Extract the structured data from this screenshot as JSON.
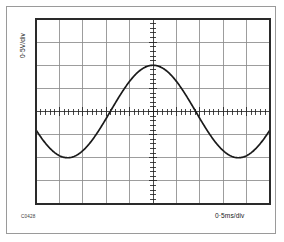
{
  "figure": {
    "code": "C0428",
    "background_color": "#ffffff",
    "frame_color": "#9a9a9a"
  },
  "labels": {
    "vertical_axis": "0·5V/div",
    "horizontal_axis": "0·5ms/div"
  },
  "chart_data": {
    "type": "line",
    "title": "",
    "subtitle": "",
    "xlabel": "0·5ms/div",
    "ylabel": "0·5V/div",
    "grid": true,
    "legend_position": "none",
    "annotations": [
      "C0428"
    ],
    "graticule": {
      "horizontal_divisions": 10,
      "vertical_divisions": 8,
      "division_px_x": 23.4,
      "division_px_y": 23.1,
      "grid_line_color": "#8c8c8c",
      "border_color": "#2a2a2a",
      "center_axis_ticks": true,
      "ticks_per_division": 5
    },
    "waveform": {
      "shape": "sine",
      "trace_color": "#1a1a1a",
      "trace_width_px": 1.6,
      "amplitude_divisions": 2.0,
      "amplitude_volts": 1.0,
      "peak_to_peak_volts": 2.0,
      "period_divisions": 7.3,
      "period_ms": 3.65,
      "frequency_hz": 274,
      "volts_per_division": 0.5,
      "ms_per_division": 0.5,
      "offset_divisions": 0,
      "phase_description": "descending at left edge, trough at 1.1 div, peak at 5.0 div, trough at 8.85 div, ascending at right edge"
    },
    "x": [
      0.0,
      0.3,
      0.6,
      0.9,
      1.2,
      1.5,
      1.8,
      2.1,
      2.4,
      2.7,
      3.0,
      3.3,
      3.6,
      3.9,
      4.2,
      4.5,
      4.8,
      5.1,
      5.4,
      5.7,
      6.0,
      6.3,
      6.6,
      6.9,
      7.2,
      7.5,
      7.8,
      8.1,
      8.4,
      8.7,
      9.0,
      9.3,
      9.6,
      9.9,
      10.0
    ],
    "y": [
      -1.49,
      -1.79,
      -1.95,
      -2.0,
      -1.93,
      -1.74,
      -1.45,
      -1.08,
      -0.65,
      -0.18,
      0.3,
      0.77,
      1.2,
      1.56,
      1.83,
      1.97,
      2.0,
      1.9,
      1.68,
      1.36,
      0.96,
      0.5,
      0.02,
      -0.46,
      -0.91,
      -1.31,
      -1.64,
      -1.87,
      -1.99,
      -1.99,
      -1.87,
      -1.64,
      -1.31,
      -0.91,
      -0.76
    ],
    "x_unit": "divisions",
    "y_unit": "divisions",
    "xlim": [
      0,
      10
    ],
    "ylim": [
      -4,
      4
    ],
    "tick_labels_x": [],
    "tick_labels_y": []
  }
}
